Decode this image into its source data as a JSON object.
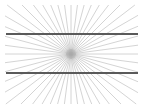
{
  "figure": {
    "type": "optical-illusion-figure",
    "width": 143,
    "height": 109,
    "background_color": "#ffffff"
  },
  "chart_data": {
    "type": "line",
    "xlabel": "",
    "ylabel": "",
    "xlim": [
      0,
      143
    ],
    "ylim": [
      0,
      109
    ],
    "grid": false,
    "legend": null,
    "annotations": [],
    "vanishing_point": {
      "x": 71,
      "y": 54
    },
    "radial_rays": {
      "count": 48,
      "color": "#b0b0b0",
      "stroke_width": 0.55,
      "angle_step_deg": 7.5,
      "angle_start_deg": 0,
      "description": "Evenly spaced rays radiating outward from the vanishing point and clipped to the drawing margin box"
    },
    "parallel_lines": {
      "count": 2,
      "color": "#5a5a5a",
      "stroke_width": 1.05,
      "x_start": 6,
      "x_end": 138,
      "y_values": [
        34,
        73
      ],
      "description": "Two straight horizontal parallel lines that appear bowed outward because of the radial background"
    },
    "drawing_box": {
      "left": 5,
      "top": 5,
      "right": 138,
      "bottom": 104
    }
  }
}
